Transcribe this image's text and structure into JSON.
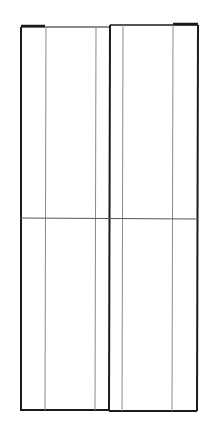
{
  "diagram": {
    "type": "elevation-drawing",
    "colors": {
      "background": "#ffffff",
      "outline": "#1a1a1a",
      "thin_line": "#8a8a8a",
      "rail_line": "#555555"
    },
    "left_panel": {
      "x1": 21,
      "x2": 110,
      "y1": 27,
      "y2": 410,
      "inner_lines_x": [
        46,
        96
      ],
      "top_cap": {
        "x1": 21,
        "x2": 45,
        "y": 26
      }
    },
    "right_panel": {
      "x1": 110,
      "x2": 198,
      "y1": 25,
      "y2": 410,
      "inner_lines_x": [
        123,
        173
      ],
      "top_cap": {
        "x1": 173,
        "x2": 198,
        "y": 24
      }
    },
    "mid_rail_y": 218
  }
}
